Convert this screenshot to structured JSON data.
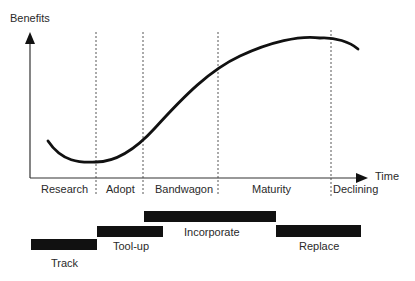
{
  "axes": {
    "y_label": "Benefits",
    "x_label": "Time"
  },
  "phases": [
    "Research",
    "Adopt",
    "Bandwagon",
    "Maturity",
    "Declining"
  ],
  "activities": [
    {
      "label": "Track"
    },
    {
      "label": "Tool-up"
    },
    {
      "label": "Incorporate"
    },
    {
      "label": "Replace"
    }
  ],
  "colors": {
    "line": "#111111",
    "bar": "#111111",
    "text": "#2a2a2a"
  }
}
